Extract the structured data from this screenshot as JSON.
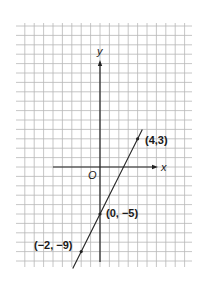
{
  "graph": {
    "axis_labels": {
      "x": "x",
      "y": "y",
      "origin": "O"
    },
    "grid": {
      "cell_px": 9.4,
      "left": 16,
      "top": 23,
      "right": 192,
      "bottom": 267,
      "color": "#b8b8b8"
    },
    "origin_px": {
      "x": 100,
      "y": 167
    },
    "axis_color": "#222222",
    "line_color": "#222222",
    "points": [
      {
        "label": "(4,3)",
        "x": 4,
        "y": 3
      },
      {
        "label": "(0, −5)",
        "x": 0,
        "y": -5
      },
      {
        "label": "(−2, −9)",
        "x": -2,
        "y": -9
      }
    ],
    "line": {
      "slope": 2,
      "intercept": -5,
      "equation": "y = 2x - 5"
    }
  },
  "chart_data": {
    "type": "line",
    "title": "",
    "xlabel": "x",
    "ylabel": "y",
    "series": [
      {
        "name": "y = 2x - 5",
        "x": [
          -2,
          0,
          4
        ],
        "y": [
          -9,
          -5,
          3
        ]
      }
    ],
    "annotations": [
      "(4,3)",
      "(0, -5)",
      "(-2, -9)",
      "O"
    ],
    "grid": true,
    "xlim": [
      -9,
      9
    ],
    "ylim": [
      -10,
      15
    ]
  }
}
